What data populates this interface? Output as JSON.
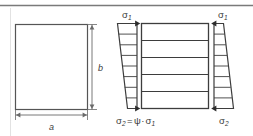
{
  "figure": {
    "background_color": "#ffffff",
    "line_color": "#4a4a4a",
    "text_color": "#3a3a3a",
    "top_rule_color": "#7a7a7a"
  },
  "left_panel": {
    "name": "plate-geometry",
    "shape": "rectangle",
    "width_label": "a",
    "height_label": "b"
  },
  "right_panel": {
    "name": "stress-distribution",
    "plate": {
      "band_count": 5,
      "divider_count": 4
    },
    "left_diagram": {
      "top_label_greek": "σ",
      "top_label_sub": "1",
      "bottom_label": "σ₂ = ψ · σ₁",
      "bottom_label_parts": {
        "sigma": "σ",
        "sub_2": "2",
        "equals": "=",
        "psi": "ψ",
        "dot": "·",
        "sigma2": "σ",
        "sub_1": "1"
      },
      "shape": "trapezoid",
      "orientation": "wide-at-top",
      "tick_count": 7
    },
    "right_diagram": {
      "top_label_greek": "σ",
      "top_label_sub": "1",
      "bottom_label_greek": "σ",
      "bottom_label_sub": "2",
      "shape": "trapezoid",
      "orientation": "narrow-at-top",
      "tick_count": 7
    }
  }
}
